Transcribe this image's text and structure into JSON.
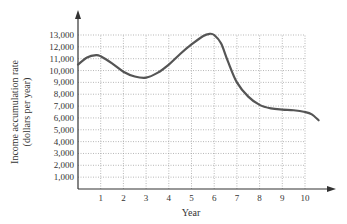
{
  "chart_data": {
    "type": "line",
    "title": "",
    "xlabel": "Year",
    "ylabel": "Income accumulation rate",
    "ylabel_sub": "(dollars per year)",
    "xlim": [
      0,
      10.6
    ],
    "ylim": [
      0,
      13000
    ],
    "grid": true,
    "grid_style": "dotted",
    "x_ticks": [
      1,
      2,
      3,
      4,
      5,
      6,
      7,
      8,
      9,
      10
    ],
    "y_ticks": [
      1000,
      2000,
      3000,
      4000,
      5000,
      6000,
      7000,
      8000,
      9000,
      10000,
      11000,
      12000,
      13000
    ],
    "y_tick_labels": [
      "1,000",
      "2,000",
      "3,000",
      "4,000",
      "5,000",
      "6,000",
      "7,000",
      "8,000",
      "9,000",
      "10,000",
      "11,000",
      "12,000",
      "13,000"
    ],
    "series": [
      {
        "name": "Income accumulation rate",
        "color": "#555555",
        "x": [
          0,
          0.4,
          0.8,
          1,
          1.5,
          2,
          2.5,
          3,
          3.5,
          4,
          4.5,
          5,
          5.5,
          5.8,
          6,
          6.3,
          6.6,
          7,
          7.5,
          8,
          8.5,
          9,
          9.5,
          10,
          10.3,
          10.6
        ],
        "y": [
          10500,
          11100,
          11300,
          11200,
          10600,
          9900,
          9500,
          9400,
          9800,
          10500,
          11400,
          12200,
          12900,
          13100,
          13000,
          12300,
          10800,
          9000,
          7800,
          7100,
          6800,
          6700,
          6650,
          6500,
          6300,
          5800
        ]
      }
    ]
  }
}
